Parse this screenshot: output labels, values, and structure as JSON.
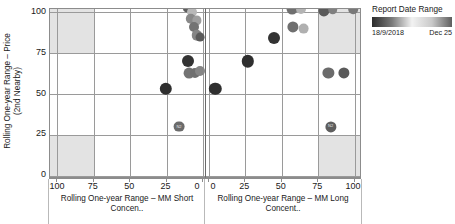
{
  "chart_data": {
    "type": "scatter",
    "title": "",
    "panels": [
      {
        "name": "left",
        "xlabel_line1": "Rolling One-year Range – MM Short",
        "xlabel_line2": "Concen..",
        "xticks": [
          100,
          75,
          50,
          25,
          0
        ],
        "xlim": [
          105,
          -2
        ],
        "reversed": true,
        "shaded_quadrants": [
          {
            "x0": 105,
            "x1": 75,
            "y0": 75,
            "y1": 102
          },
          {
            "x0": 105,
            "x1": 75,
            "y0": -2,
            "y1": 25
          }
        ],
        "points": [
          {
            "x": 10.5,
            "y": 103,
            "shade": 0.32,
            "r": 5.2
          },
          {
            "x": 7.5,
            "y": 100,
            "shade": 0.74,
            "r": 5.0
          },
          {
            "x": 8.5,
            "y": 96,
            "shade": 0.52,
            "r": 5.2
          },
          {
            "x": 4.0,
            "y": 95,
            "shade": 0.62,
            "r": 4.6
          },
          {
            "x": 6.5,
            "y": 91,
            "shade": 0.42,
            "r": 5.0
          },
          {
            "x": 4.5,
            "y": 86,
            "shade": 0.5,
            "r": 5.2
          },
          {
            "x": 2.0,
            "y": 85,
            "shade": 0.3,
            "r": 4.4
          },
          {
            "x": 10.5,
            "y": 70,
            "shade": 0.12,
            "r": 6.0
          },
          {
            "x": 9.5,
            "y": 63,
            "shade": 0.42,
            "r": 5.4
          },
          {
            "x": 5.5,
            "y": 63,
            "shade": 0.4,
            "r": 5.0
          },
          {
            "x": 2.0,
            "y": 64,
            "shade": 0.5,
            "r": 5.0
          },
          {
            "x": 25.5,
            "y": 53,
            "shade": 0.1,
            "r": 6.2
          },
          {
            "x": 16.5,
            "y": 30,
            "shade": 0.38,
            "r": 5.4,
            "label": "N2"
          }
        ]
      },
      {
        "name": "right",
        "xlabel_line1": "Rolling One-year Range – MM Long",
        "xlabel_line2": "Concent..",
        "xticks": [
          0,
          25,
          50,
          75,
          100
        ],
        "xlim": [
          -2,
          105
        ],
        "reversed": false,
        "shaded_quadrants": [
          {
            "x0": 75,
            "x1": 105,
            "y0": 75,
            "y1": 102
          },
          {
            "x0": 75,
            "x1": 105,
            "y0": -2,
            "y1": 25
          }
        ],
        "points": [
          {
            "x": 57.0,
            "y": 102,
            "shade": 0.4,
            "r": 5.4
          },
          {
            "x": 63.0,
            "y": 102,
            "shade": 0.72,
            "r": 5.0
          },
          {
            "x": 79.0,
            "y": 101,
            "shade": 0.3,
            "r": 5.6
          },
          {
            "x": 85.0,
            "y": 102,
            "shade": 0.48,
            "r": 4.8
          },
          {
            "x": 99.0,
            "y": 102,
            "shade": 0.44,
            "r": 4.8
          },
          {
            "x": 57.5,
            "y": 91,
            "shade": 0.4,
            "r": 5.6
          },
          {
            "x": 65.0,
            "y": 90,
            "shade": 0.7,
            "r": 5.4
          },
          {
            "x": 44.5,
            "y": 84,
            "shade": 0.12,
            "r": 6.0
          },
          {
            "x": 26.5,
            "y": 70,
            "shade": 0.1,
            "r": 6.2
          },
          {
            "x": 82.0,
            "y": 63,
            "shade": 0.38,
            "r": 5.6
          },
          {
            "x": 92.5,
            "y": 63,
            "shade": 0.3,
            "r": 5.6
          },
          {
            "x": 4.5,
            "y": 53,
            "shade": 0.1,
            "r": 6.2
          },
          {
            "x": 83.5,
            "y": 30,
            "shade": 0.32,
            "r": 5.6,
            "label": "N2"
          }
        ]
      }
    ],
    "ylabel_line1": "Rolling One-year Range – Price",
    "ylabel_line2": "(2nd Nearby)",
    "yticks": [
      0,
      25,
      50,
      75,
      100
    ],
    "ylim": [
      -2,
      102
    ],
    "grid": true,
    "legend": {
      "position": "top-right",
      "title": "Report Date Range",
      "min_label": "18/9/2018",
      "max_label": "Dec 25",
      "type": "gradient",
      "colors": [
        "#2b2b2b",
        "#7a7a7a",
        "#f2f2f2",
        "#c9c9c9",
        "#5e5e5e"
      ]
    },
    "colors": {
      "grid": "#9a9a9a",
      "axis": "#8c8c8c",
      "shade": "#e3e3e3",
      "marker_dark": "#2b2b2b",
      "marker_light": "#d8d8d8",
      "text": "#1a1a1a"
    }
  }
}
